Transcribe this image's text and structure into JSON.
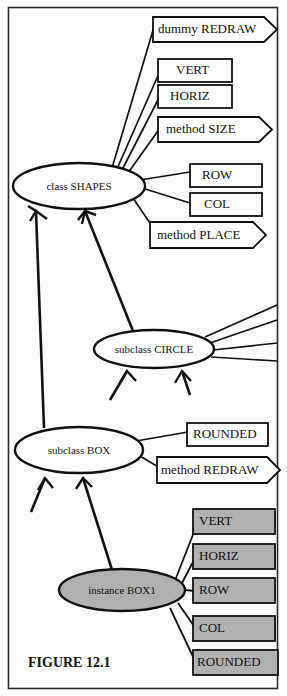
{
  "figure": {
    "caption": "FIGURE 12.1",
    "frame": {
      "stroke": "#2a2a2a"
    },
    "background": "#fdfdfb"
  },
  "colors": {
    "line": "#111111",
    "white_fill": "#ffffff",
    "gray_fill": "#b0b0b0",
    "text": "#111111"
  },
  "nodes": {
    "class_shapes": {
      "label": "class SHAPES",
      "shape": "ellipse",
      "fill": "white"
    },
    "subclass_circle": {
      "label": "subclass CIRCLE",
      "shape": "ellipse",
      "fill": "white"
    },
    "subclass_box": {
      "label": "subclass BOX",
      "shape": "ellipse",
      "fill": "white"
    },
    "instance_box1": {
      "label": "instance BOX1",
      "shape": "ellipse",
      "fill": "gray"
    }
  },
  "shapes_attributes": [
    {
      "label": "dummy REDRAW",
      "shape": "pentagon",
      "fill": "white"
    },
    {
      "label": "VERT",
      "shape": "rect",
      "fill": "white"
    },
    {
      "label": "HORIZ",
      "shape": "rect",
      "fill": "white"
    },
    {
      "label": "method SIZE",
      "shape": "pentagon",
      "fill": "white"
    },
    {
      "label": "ROW",
      "shape": "rect",
      "fill": "white"
    },
    {
      "label": "COL",
      "shape": "rect",
      "fill": "white"
    },
    {
      "label": "method PLACE",
      "shape": "pentagon",
      "fill": "white"
    }
  ],
  "box_attributes": [
    {
      "label": "ROUNDED",
      "shape": "rect",
      "fill": "white"
    },
    {
      "label": "method REDRAW",
      "shape": "pentagon",
      "fill": "white"
    }
  ],
  "instance_attributes": [
    {
      "label": "VERT",
      "shape": "rect",
      "fill": "gray"
    },
    {
      "label": "HORIZ",
      "shape": "rect",
      "fill": "gray"
    },
    {
      "label": "ROW",
      "shape": "rect",
      "fill": "gray"
    },
    {
      "label": "COL",
      "shape": "rect",
      "fill": "gray"
    },
    {
      "label": "ROUNDED",
      "shape": "rect",
      "fill": "gray"
    }
  ],
  "circle_attributes_hidden_count": 4,
  "inheritance_arrows": [
    {
      "from": "subclass BOX",
      "to": "class SHAPES"
    },
    {
      "from": "subclass CIRCLE",
      "to": "class SHAPES"
    },
    {
      "from": "instance BOX1",
      "to": "subclass BOX"
    }
  ]
}
